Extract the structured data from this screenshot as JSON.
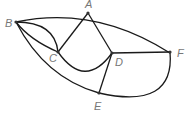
{
  "diagram": {
    "type": "graph",
    "nodes": [
      {
        "id": "A",
        "label": "A"
      },
      {
        "id": "B",
        "label": "B"
      },
      {
        "id": "C",
        "label": "C"
      },
      {
        "id": "D",
        "label": "D"
      },
      {
        "id": "E",
        "label": "E"
      },
      {
        "id": "F",
        "label": "F"
      }
    ],
    "edges": [
      [
        "B",
        "A"
      ],
      [
        "A",
        "F"
      ],
      [
        "B",
        "C"
      ],
      [
        "B",
        "C"
      ],
      [
        "B",
        "E"
      ],
      [
        "A",
        "C"
      ],
      [
        "A",
        "D"
      ],
      [
        "C",
        "D"
      ],
      [
        "D",
        "F"
      ],
      [
        "D",
        "E"
      ],
      [
        "E",
        "F"
      ]
    ]
  }
}
